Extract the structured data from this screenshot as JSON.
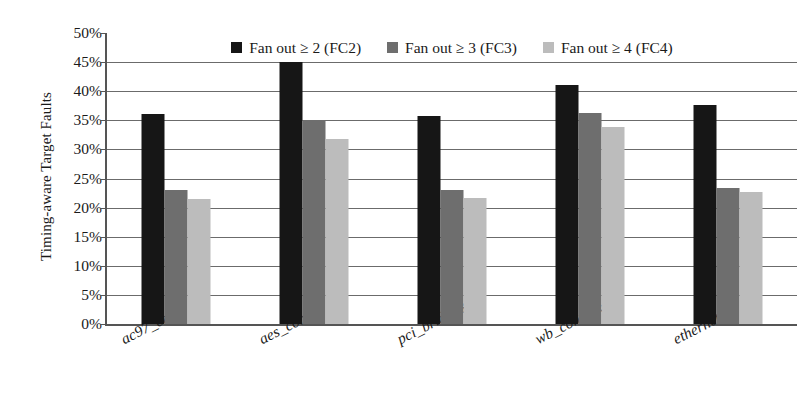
{
  "chart_data": {
    "type": "bar",
    "title": "",
    "xlabel": "",
    "ylabel": "Timing-aware Target Faults",
    "categories": [
      "ac97_ctrl",
      "aes_core",
      "pci_bridge32",
      "wb_conmax",
      "ethernet"
    ],
    "series": [
      {
        "name": "Fan out ≥ 2 (FC2)",
        "color": "#161616",
        "values": [
          36.0,
          45.2,
          35.8,
          41.0,
          37.6
        ]
      },
      {
        "name": "Fan out ≥ 3 (FC3)",
        "color": "#6e6e6e",
        "values": [
          23.0,
          35.0,
          23.1,
          36.3,
          23.4
        ]
      },
      {
        "name": "Fan out ≥ 4 (FC4)",
        "color": "#bcbcbc",
        "values": [
          21.5,
          31.8,
          21.6,
          33.8,
          22.6
        ]
      }
    ],
    "ylim": [
      0,
      50
    ],
    "ytick_step": 5,
    "ytick_labels": [
      "50%",
      "45%",
      "40%",
      "35%",
      "30%",
      "25%",
      "20%",
      "15%",
      "10%",
      "5%",
      "0%"
    ],
    "ytick_values": [
      50,
      45,
      40,
      35,
      30,
      25,
      20,
      15,
      10,
      5,
      0
    ],
    "grid": true,
    "legend_position": "top-inside"
  }
}
